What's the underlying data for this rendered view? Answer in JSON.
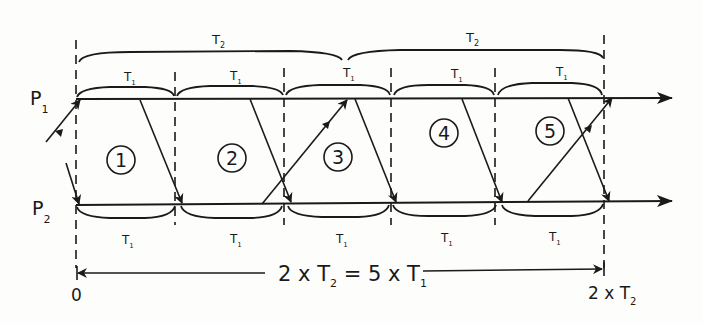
{
  "diagram": {
    "title": "",
    "lines": [
      {
        "id": "p1",
        "label": "P",
        "subscript": "1"
      },
      {
        "id": "p2",
        "label": "P",
        "subscript": "2"
      }
    ],
    "top_braces": [
      {
        "label": "T",
        "subscript": "2"
      },
      {
        "label": "T",
        "subscript": "2"
      }
    ],
    "p1_interval_labels": [
      {
        "label": "T",
        "subscript": "1"
      },
      {
        "label": "T",
        "subscript": "1"
      },
      {
        "label": "T",
        "subscript": "1"
      },
      {
        "label": "T",
        "subscript": "1"
      },
      {
        "label": "T",
        "subscript": "1"
      }
    ],
    "p2_interval_labels": [
      {
        "label": "T",
        "subscript": "1"
      },
      {
        "label": "T",
        "subscript": "1"
      },
      {
        "label": "T",
        "subscript": "1"
      },
      {
        "label": "T",
        "subscript": "1"
      },
      {
        "label": "T",
        "subscript": "1"
      }
    ],
    "regions": [
      "1",
      "2",
      "3",
      "4",
      "5"
    ],
    "bottom_span": {
      "left_part": "2 x T",
      "left_sub": "2",
      "middle": " = 5 x T",
      "right_sub": "1"
    },
    "axis_start": "0",
    "axis_end": {
      "label": "2 x T",
      "subscript": "2"
    }
  }
}
